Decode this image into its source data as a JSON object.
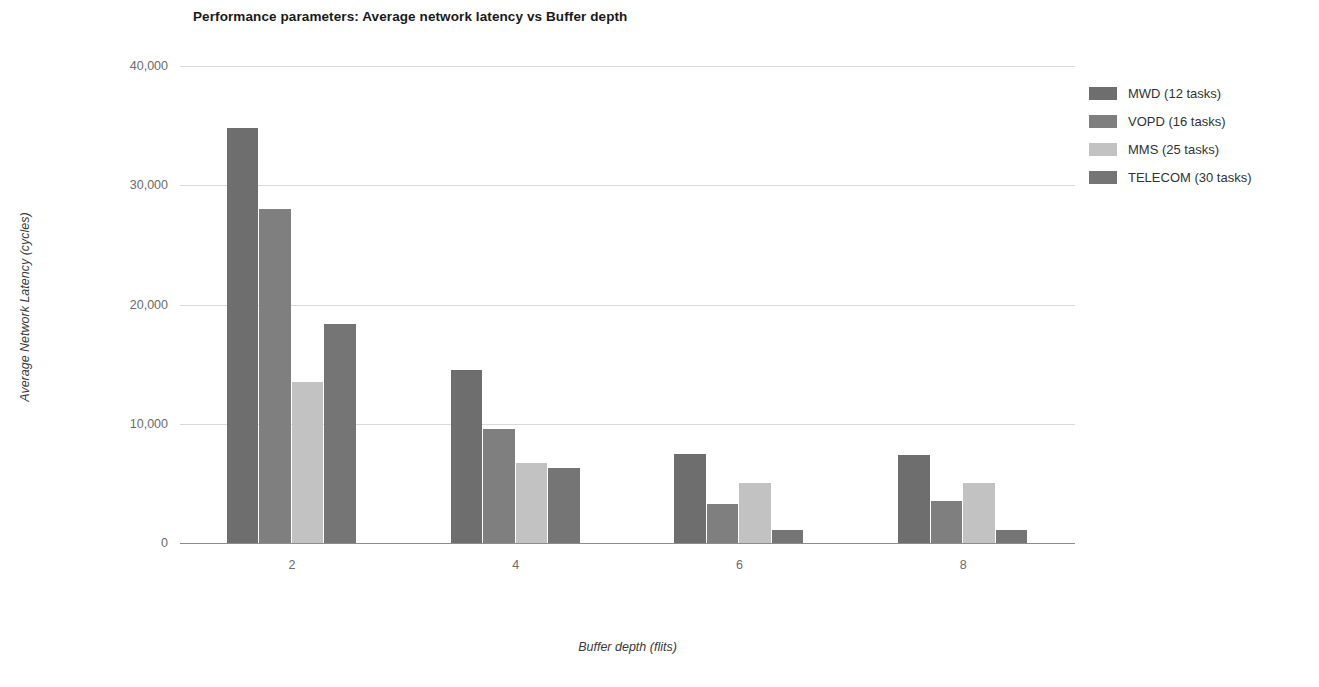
{
  "chart_data": {
    "type": "bar",
    "title": "Performance parameters: Average network latency vs Buffer depth",
    "xlabel": "Buffer depth (flits)",
    "ylabel": "Average Network Latency (cycles)",
    "categories": [
      "2",
      "4",
      "6",
      "8"
    ],
    "ytick_labels": [
      "0",
      "10,000",
      "20,000",
      "30,000",
      "40,000"
    ],
    "ytick_values": [
      0,
      10000,
      20000,
      30000,
      40000
    ],
    "ylim": [
      0,
      40000
    ],
    "grid": true,
    "legend_position": "right",
    "series": [
      {
        "name": "MWD (12 tasks)",
        "color": "#6e6e6e",
        "values": [
          34800,
          14500,
          7500,
          7400
        ]
      },
      {
        "name": "VOPD (16 tasks)",
        "color": "#7f7f7f",
        "values": [
          28000,
          9600,
          3300,
          3500
        ]
      },
      {
        "name": "MMS (25 tasks)",
        "color": "#c2c2c2",
        "values": [
          13500,
          6700,
          5000,
          5000
        ]
      },
      {
        "name": "TELECOM (30 tasks)",
        "color": "#757575",
        "values": [
          18400,
          6300,
          1050,
          1050
        ]
      }
    ]
  },
  "legend": {
    "items": [
      {
        "label": "MWD (12 tasks)",
        "color": "#6e6e6e"
      },
      {
        "label": "VOPD (16 tasks)",
        "color": "#7f7f7f"
      },
      {
        "label": "MMS (25 tasks)",
        "color": "#c2c2c2"
      },
      {
        "label": "TELECOM (30 tasks)",
        "color": "#757575"
      }
    ]
  }
}
